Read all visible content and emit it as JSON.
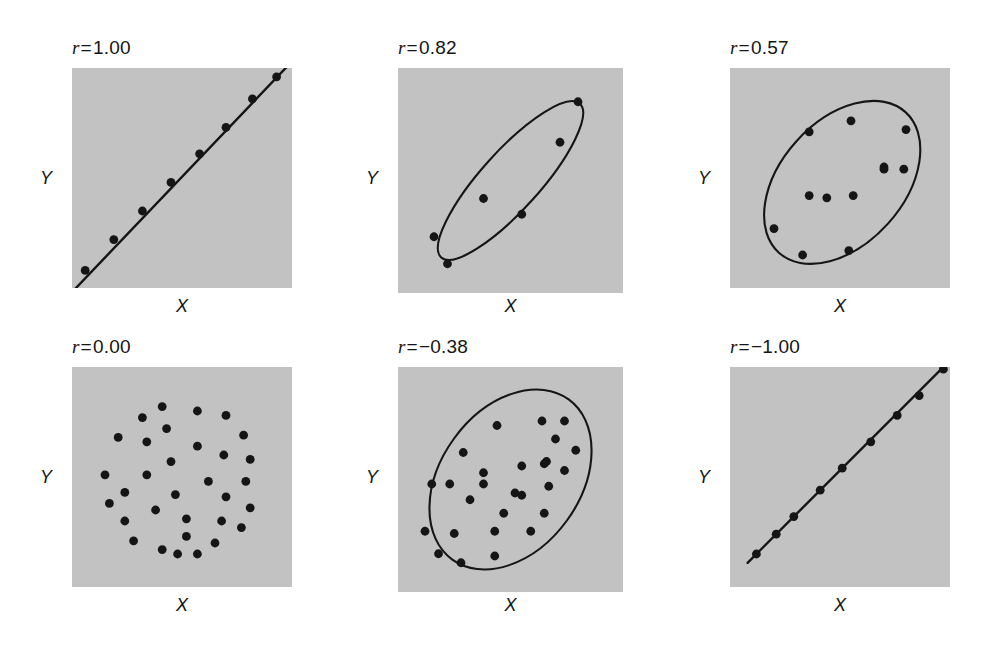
{
  "figure": {
    "title": "",
    "background_color": "#ffffff",
    "panel_fill_color": "#c2c2c2",
    "ink_color": "#151515",
    "rows": 2,
    "cols": 3
  },
  "labels": {
    "x_axis": "X",
    "y_axis": "Y",
    "r_symbol": "r",
    "equals": "="
  },
  "chart_data": [
    {
      "type": "scatter",
      "title": "r = 1.00",
      "r_value": 1.0,
      "r_text": "1.00",
      "xlabel": "X",
      "ylabel": "Y",
      "xlim": [
        0,
        100
      ],
      "ylim": [
        0,
        100
      ],
      "grid": false,
      "legend": "none",
      "annotation": "perfect positive linear relationship",
      "envelope": null,
      "trend_line": {
        "x1": -2,
        "y1": -4,
        "x2": 100,
        "y2": 103
      },
      "points": [
        {
          "x": 6,
          "y": 8
        },
        {
          "x": 19,
          "y": 22
        },
        {
          "x": 32,
          "y": 35
        },
        {
          "x": 45,
          "y": 48
        },
        {
          "x": 58,
          "y": 61
        },
        {
          "x": 70,
          "y": 73
        },
        {
          "x": 82,
          "y": 86
        },
        {
          "x": 93,
          "y": 96
        }
      ]
    },
    {
      "type": "scatter",
      "title": "r = 0.82",
      "r_value": 0.82,
      "r_text": "0.82",
      "xlabel": "X",
      "ylabel": "Y",
      "xlim": [
        0,
        100
      ],
      "ylim": [
        0,
        100
      ],
      "grid": false,
      "legend": "none",
      "annotation": "strong positive relationship, narrow ellipse",
      "envelope": {
        "cx": 50,
        "cy": 50,
        "rx": 46,
        "ry": 13,
        "rotation_deg": -48
      },
      "trend_line": null,
      "points": [
        {
          "x": 22,
          "y": 13
        },
        {
          "x": 16,
          "y": 25
        },
        {
          "x": 38,
          "y": 42
        },
        {
          "x": 55,
          "y": 35
        },
        {
          "x": 72,
          "y": 67
        },
        {
          "x": 80,
          "y": 85
        }
      ]
    },
    {
      "type": "scatter",
      "title": "r = 0.57",
      "r_value": 0.57,
      "r_text": "0.57",
      "xlabel": "X",
      "ylabel": "Y",
      "xlim": [
        0,
        100
      ],
      "ylim": [
        0,
        100
      ],
      "grid": false,
      "legend": "none",
      "annotation": "moderate positive relationship, broad ellipse",
      "envelope": {
        "cx": 51,
        "cy": 48,
        "rx": 43,
        "ry": 28,
        "rotation_deg": -48
      },
      "trend_line": null,
      "points": [
        {
          "x": 33,
          "y": 15
        },
        {
          "x": 54,
          "y": 17
        },
        {
          "x": 20,
          "y": 27
        },
        {
          "x": 44,
          "y": 41
        },
        {
          "x": 70,
          "y": 54
        },
        {
          "x": 80,
          "y": 72
        },
        {
          "x": 36,
          "y": 42
        },
        {
          "x": 56,
          "y": 42
        },
        {
          "x": 70,
          "y": 55
        },
        {
          "x": 79,
          "y": 54
        },
        {
          "x": 36,
          "y": 71
        },
        {
          "x": 55,
          "y": 76
        }
      ]
    },
    {
      "type": "scatter",
      "title": "r = 0.00",
      "r_value": 0.0,
      "r_text": "0.00",
      "xlabel": "X",
      "ylabel": "Y",
      "xlim": [
        0,
        100
      ],
      "ylim": [
        0,
        100
      ],
      "grid": false,
      "legend": "none",
      "annotation": "no relationship, circular cloud of points",
      "envelope": null,
      "trend_line": null,
      "points": [
        {
          "x": 41,
          "y": 17
        },
        {
          "x": 48,
          "y": 15
        },
        {
          "x": 57,
          "y": 15
        },
        {
          "x": 28,
          "y": 21
        },
        {
          "x": 65,
          "y": 20
        },
        {
          "x": 52,
          "y": 23
        },
        {
          "x": 24,
          "y": 30
        },
        {
          "x": 52,
          "y": 31
        },
        {
          "x": 68,
          "y": 30
        },
        {
          "x": 77,
          "y": 27
        },
        {
          "x": 17,
          "y": 38
        },
        {
          "x": 38,
          "y": 35
        },
        {
          "x": 81,
          "y": 36
        },
        {
          "x": 70,
          "y": 41
        },
        {
          "x": 24,
          "y": 43
        },
        {
          "x": 47,
          "y": 42
        },
        {
          "x": 15,
          "y": 51
        },
        {
          "x": 34,
          "y": 51
        },
        {
          "x": 62,
          "y": 48
        },
        {
          "x": 79,
          "y": 48
        },
        {
          "x": 45,
          "y": 57
        },
        {
          "x": 69,
          "y": 60
        },
        {
          "x": 81,
          "y": 58
        },
        {
          "x": 21,
          "y": 68
        },
        {
          "x": 34,
          "y": 66
        },
        {
          "x": 57,
          "y": 64
        },
        {
          "x": 78,
          "y": 69
        },
        {
          "x": 43,
          "y": 72
        },
        {
          "x": 32,
          "y": 77
        },
        {
          "x": 57,
          "y": 80
        },
        {
          "x": 70,
          "y": 78
        },
        {
          "x": 41,
          "y": 82
        }
      ]
    },
    {
      "type": "scatter",
      "title": "r = -0.38",
      "r_value": -0.38,
      "r_text": "−0.38",
      "xlabel": "X",
      "ylabel": "Y",
      "xlim": [
        0,
        100
      ],
      "ylim": [
        0,
        100
      ],
      "grid": false,
      "legend": "none",
      "annotation": "weak relationship, wide ellipse with dense scatter",
      "envelope": {
        "cx": 50,
        "cy": 50,
        "rx": 44,
        "ry": 31,
        "rotation_deg": -54
      },
      "trend_line": null,
      "points": [
        {
          "x": 28,
          "y": 13
        },
        {
          "x": 18,
          "y": 17
        },
        {
          "x": 43,
          "y": 16
        },
        {
          "x": 12,
          "y": 27
        },
        {
          "x": 25,
          "y": 26
        },
        {
          "x": 43,
          "y": 27
        },
        {
          "x": 59,
          "y": 27
        },
        {
          "x": 47,
          "y": 35
        },
        {
          "x": 65,
          "y": 35
        },
        {
          "x": 32,
          "y": 41
        },
        {
          "x": 52,
          "y": 44
        },
        {
          "x": 15,
          "y": 48
        },
        {
          "x": 23,
          "y": 48
        },
        {
          "x": 38,
          "y": 48
        },
        {
          "x": 55,
          "y": 43
        },
        {
          "x": 67,
          "y": 47
        },
        {
          "x": 38,
          "y": 53
        },
        {
          "x": 55,
          "y": 56
        },
        {
          "x": 65,
          "y": 57
        },
        {
          "x": 74,
          "y": 54
        },
        {
          "x": 29,
          "y": 62
        },
        {
          "x": 66,
          "y": 58
        },
        {
          "x": 79,
          "y": 63
        },
        {
          "x": 70,
          "y": 68
        },
        {
          "x": 44,
          "y": 74
        },
        {
          "x": 64,
          "y": 76
        },
        {
          "x": 74,
          "y": 76
        }
      ]
    },
    {
      "type": "scatter",
      "title": "r = -1.00",
      "r_value": -1.0,
      "r_text": "−1.00",
      "xlabel": "X",
      "ylabel": "Y",
      "xlim": [
        0,
        100
      ],
      "ylim": [
        0,
        100
      ],
      "grid": false,
      "legend": "none",
      "annotation": "perfect negative linear relationship",
      "envelope": null,
      "trend_line": {
        "x1": 8,
        "y1": 11,
        "x2": 100,
        "y2": 103
      },
      "points": [
        {
          "x": 12,
          "y": 15
        },
        {
          "x": 21,
          "y": 24
        },
        {
          "x": 29,
          "y": 32
        },
        {
          "x": 41,
          "y": 44
        },
        {
          "x": 51,
          "y": 54
        },
        {
          "x": 64,
          "y": 66
        },
        {
          "x": 76,
          "y": 78
        },
        {
          "x": 86,
          "y": 87
        },
        {
          "x": 97,
          "y": 99
        }
      ]
    }
  ],
  "panel_geometry": [
    {
      "left": 72,
      "top": 68,
      "size": 220,
      "label_left": 72,
      "label_top": 37,
      "x_label_top": 296,
      "y_label_left": 44,
      "y_label_top": 168
    },
    {
      "left": 398,
      "top": 68,
      "size": 225,
      "label_left": 398,
      "label_top": 37,
      "x_label_top": 296,
      "y_label_left": 370,
      "y_label_top": 168
    },
    {
      "left": 730,
      "top": 68,
      "size": 220,
      "label_left": 730,
      "label_top": 37,
      "x_label_top": 296,
      "y_label_left": 702,
      "y_label_top": 168
    },
    {
      "left": 72,
      "top": 367,
      "size": 220,
      "label_left": 72,
      "label_top": 336,
      "x_label_top": 595,
      "y_label_left": 44,
      "y_label_top": 467
    },
    {
      "left": 398,
      "top": 367,
      "size": 225,
      "label_left": 398,
      "label_top": 336,
      "x_label_top": 595,
      "y_label_left": 370,
      "y_label_top": 467
    },
    {
      "left": 730,
      "top": 367,
      "size": 220,
      "label_left": 730,
      "label_top": 336,
      "x_label_top": 595,
      "y_label_left": 702,
      "y_label_top": 467
    }
  ]
}
